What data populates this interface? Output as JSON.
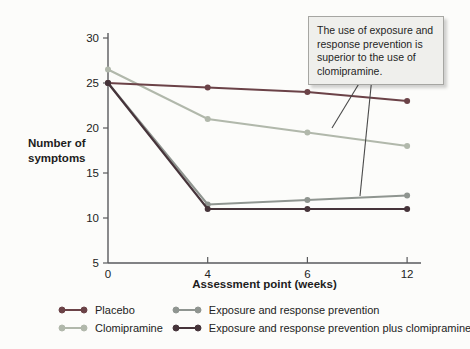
{
  "chart_data": {
    "type": "line",
    "categories": [
      "0",
      "4",
      "6",
      "12"
    ],
    "x_weeks": [
      0,
      4,
      6,
      12
    ],
    "series": [
      {
        "name": "Placebo",
        "values": [
          25,
          24.5,
          24,
          23
        ],
        "color": "#6b4247"
      },
      {
        "name": "Clomipramine",
        "values": [
          26.5,
          21,
          19.5,
          18
        ],
        "color": "#b1b8ab"
      },
      {
        "name": "Exposure and response prevention",
        "values": [
          25,
          11.5,
          12,
          12.5
        ],
        "color": "#8f9590"
      },
      {
        "name": "Exposure and response prevention plus clomipramine",
        "values": [
          25,
          11,
          11,
          11
        ],
        "color": "#46343a"
      }
    ],
    "xlabel": "Assessment point (weeks)",
    "ylabel": "Number of symptoms",
    "ylim": [
      5,
      30
    ],
    "yticks": [
      30,
      25,
      20,
      15,
      10,
      5
    ],
    "grid": false,
    "legend_position": "bottom",
    "annotation": "The use of exposure and response prevention is superior to the use of clomipramine."
  }
}
